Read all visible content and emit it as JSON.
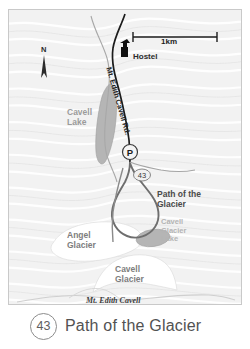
{
  "map": {
    "title_band": {
      "route_number": "43",
      "title": "Path of the Glacier"
    },
    "scale_bar": {
      "label": "1km"
    },
    "compass": {
      "label": "N"
    },
    "markers": [
      {
        "name": "hostel",
        "label": "Hostel",
        "icon": "hostel-marker-icon"
      },
      {
        "name": "parking",
        "label": "P",
        "icon": "parking-icon"
      },
      {
        "name": "trail-shield",
        "label": "43",
        "icon": "route-shield-icon"
      }
    ],
    "labels": {
      "cavell_lake": "Cavell\nLake",
      "road": "Mt. Edith Cavell Rd.",
      "path_of_the_glacier": "Path of the\nGlacier",
      "cavell_glacier_lake": "Cavell\nGlacier\nLake",
      "angel_glacier": "Angel\nGlacier",
      "cavell_glacier": "Cavell\nGlacier",
      "mt_edith_cavell": "Mt. Edith Cavell"
    },
    "colors": {
      "background": "#f2f2f2",
      "water": "#b5b5b5",
      "glacier_fill": "#ffffff",
      "trail": "#6e6e6e",
      "road": "#1c1c1c",
      "border": "#c9c9c9",
      "title_text": "#525252"
    }
  }
}
